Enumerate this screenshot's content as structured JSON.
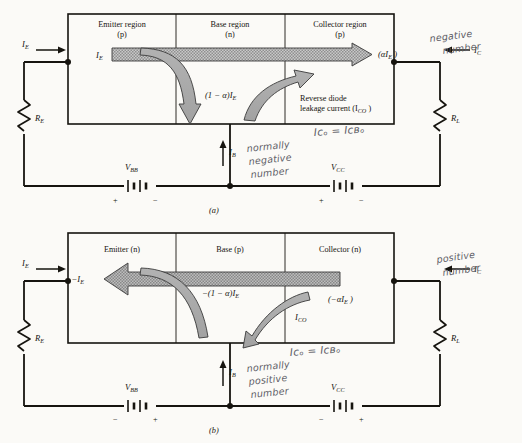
{
  "figure": {
    "panels": [
      {
        "caption": "(a)",
        "regions": [
          {
            "name": "Emitter region",
            "type": "(p)"
          },
          {
            "name": "Base region",
            "type": "(n)"
          },
          {
            "name": "Collector region",
            "type": "(p)"
          }
        ],
        "terminals": {
          "emitter_current": "I",
          "emitter_current_sub": "E",
          "collector_current": "I",
          "collector_current_sub": "C",
          "base_current": "I",
          "base_current_sub": "B"
        },
        "arrow_labels": {
          "main_in": "I",
          "main_in_sub": "E",
          "main_out": "(αI",
          "main_out_sub": "E",
          "main_out_tail": " )",
          "recombination": "(1 − α)I",
          "recombination_sub": "E",
          "leakage_line1": "Reverse diode",
          "leakage_line2": "leakage current (I",
          "leakage_line2_sub": "CO",
          "leakage_line2_tail": " )"
        },
        "resistors": [
          {
            "label": "R",
            "sub": "E"
          },
          {
            "label": "R",
            "sub": "L"
          }
        ],
        "sources": [
          {
            "label": "V",
            "sub": "BB",
            "left_sign": "+",
            "right_sign": "−"
          },
          {
            "label": "V",
            "sub": "CC",
            "left_sign": "+",
            "right_sign": "−"
          }
        ],
        "annotations": [
          {
            "name": "collector-sign-note",
            "lines": [
              "negative",
              "number"
            ]
          },
          {
            "name": "ico-identity",
            "text": "Iᴄₒ = Iᴄʙₒ"
          },
          {
            "name": "base-sign-note",
            "lines": [
              "normally",
              "negative",
              "number"
            ]
          }
        ]
      },
      {
        "caption": "(b)",
        "regions": [
          {
            "name": "Emitter (n)",
            "type": ""
          },
          {
            "name": "Base (p)",
            "type": ""
          },
          {
            "name": "Collector (n)",
            "type": ""
          }
        ],
        "terminals": {
          "emitter_current": "I",
          "emitter_current_sub": "E",
          "collector_current": "I",
          "collector_current_sub": "C",
          "base_current": "I",
          "base_current_sub": "B"
        },
        "arrow_labels": {
          "main_out": "−I",
          "main_out_sub": "E",
          "main_in": "(−αI",
          "main_in_sub": "E",
          "main_in_tail": " )",
          "recombination": "−(1 − α)I",
          "recombination_sub": "E",
          "leakage": "I",
          "leakage_sub": "CO"
        },
        "resistors": [
          {
            "label": "R",
            "sub": "E"
          },
          {
            "label": "R",
            "sub": "L"
          }
        ],
        "sources": [
          {
            "label": "V",
            "sub": "BB",
            "left_sign": "−",
            "right_sign": "+"
          },
          {
            "label": "V",
            "sub": "CC",
            "left_sign": "−",
            "right_sign": "+"
          }
        ],
        "annotations": [
          {
            "name": "collector-sign-note",
            "lines": [
              "positive",
              "number"
            ]
          },
          {
            "name": "ico-identity",
            "text": "Iᴄₒ = Iᴄʙₒ"
          },
          {
            "name": "base-sign-note",
            "lines": [
              "normally",
              "positive",
              "number"
            ]
          }
        ]
      }
    ],
    "colors": {
      "ink": "#16140f",
      "paper": "#fbfaf7",
      "arrow_fill": "#9c9c9c",
      "arrow_hatch": "#8a8a8a",
      "handwriting": "#5d5d66"
    }
  }
}
